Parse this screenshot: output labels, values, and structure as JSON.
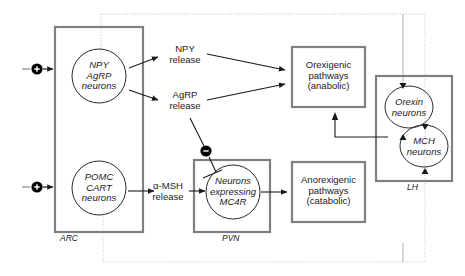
{
  "diagram": {
    "colors": {
      "box_stroke": "#808080",
      "circle_stroke": "#1a1a1a",
      "arrow": "#1a1a1a",
      "dotted_feedback": "#b5b5b5",
      "solid_feedback": "#9a9a9a",
      "text": "#1a1a1a",
      "node_fill": "#000000",
      "node_glyph": "#ffffff"
    },
    "regions": [
      {
        "id": "arc",
        "label": "ARC",
        "x": 55,
        "y": 27,
        "w": 88,
        "h": 205
      },
      {
        "id": "pvn",
        "label": "PVN",
        "x": 194,
        "y": 160,
        "w": 76,
        "h": 72
      },
      {
        "id": "lh",
        "label": "LH",
        "x": 376,
        "y": 76,
        "w": 76,
        "h": 105
      }
    ],
    "neuron_circles": [
      {
        "id": "npy-agrp",
        "lines": "NPY\nAgRP\nneurons"
      },
      {
        "id": "pomc-cart",
        "lines": "POMC\nCART\nneurons"
      },
      {
        "id": "mc4r",
        "lines": "Neurons\nexpressing\nMC4R"
      },
      {
        "id": "orexin",
        "lines": "Orexin\nneurons"
      },
      {
        "id": "mch",
        "lines": "MCH\nneurons"
      }
    ],
    "mediators": [
      {
        "id": "npy-release",
        "lines": "NPY\nrelease"
      },
      {
        "id": "agrp-release",
        "lines": "AgRP\nrelease"
      },
      {
        "id": "amsh-release",
        "lines": "α-MSH\nrelease"
      }
    ],
    "pathway_boxes": [
      {
        "id": "orexigenic",
        "lines": "Orexigenic\npathways\n(anabolic)",
        "x": 292,
        "y": 47,
        "w": 73,
        "h": 60
      },
      {
        "id": "anorexigenic",
        "lines": "Anorexigenic\npathways\n(catabolic)",
        "x": 292,
        "y": 162,
        "w": 73,
        "h": 60
      }
    ],
    "signal_nodes": [
      {
        "id": "plus-input-npy",
        "glyph": "+",
        "meaning": "stimulatory input"
      },
      {
        "id": "plus-input-pomc",
        "glyph": "+",
        "meaning": "stimulatory input"
      },
      {
        "id": "minus-agrp-mc4r",
        "glyph": "−",
        "meaning": "inhibition of MC4R neurons by AgRP"
      }
    ]
  }
}
